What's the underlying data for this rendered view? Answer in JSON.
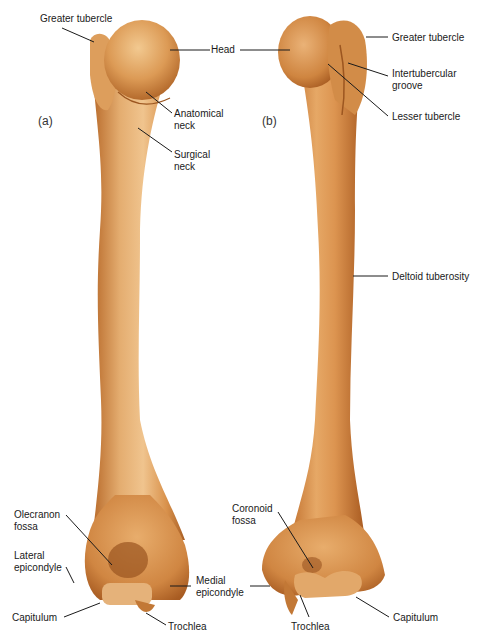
{
  "figure": {
    "colors": {
      "bone_light": "#e9b77a",
      "bone_mid": "#d9924c",
      "bone_dark": "#b86a2a",
      "bone_shadow": "#8c4a1e",
      "leader_line": "#1a1a1a",
      "background": "#ffffff"
    },
    "panels": [
      {
        "id": "a",
        "label": "(a)",
        "annotations": [
          {
            "text": "Greater tubercle",
            "lines": [
              "Greater tubercle"
            ]
          },
          {
            "text": "Head",
            "lines": [
              "Head"
            ]
          },
          {
            "text": "Anatomical neck",
            "lines": [
              "Anatomical",
              "neck"
            ]
          },
          {
            "text": "Surgical neck",
            "lines": [
              "Surgical",
              "neck"
            ]
          },
          {
            "text": "Olecranon fossa",
            "lines": [
              "Olecranon",
              "fossa"
            ]
          },
          {
            "text": "Lateral epicondyle",
            "lines": [
              "Lateral",
              "epicondyle"
            ]
          },
          {
            "text": "Medial epicondyle",
            "lines": [
              "Medial",
              "epicondyle"
            ]
          },
          {
            "text": "Capitulum",
            "lines": [
              "Capitulum"
            ]
          },
          {
            "text": "Trochlea",
            "lines": [
              "Trochlea"
            ]
          }
        ]
      },
      {
        "id": "b",
        "label": "(b)",
        "annotations": [
          {
            "text": "Greater tubercle",
            "lines": [
              "Greater tubercle"
            ]
          },
          {
            "text": "Intertubercular groove",
            "lines": [
              "Intertubercular",
              "groove"
            ]
          },
          {
            "text": "Lesser tubercle",
            "lines": [
              "Lesser tubercle"
            ]
          },
          {
            "text": "Deltoid tuberosity",
            "lines": [
              "Deltoid tuberosity"
            ]
          },
          {
            "text": "Coronoid fossa",
            "lines": [
              "Coronoid",
              "fossa"
            ]
          },
          {
            "text": "Trochlea",
            "lines": [
              "Trochlea"
            ]
          },
          {
            "text": "Capitulum",
            "lines": [
              "Capitulum"
            ]
          }
        ]
      }
    ]
  }
}
